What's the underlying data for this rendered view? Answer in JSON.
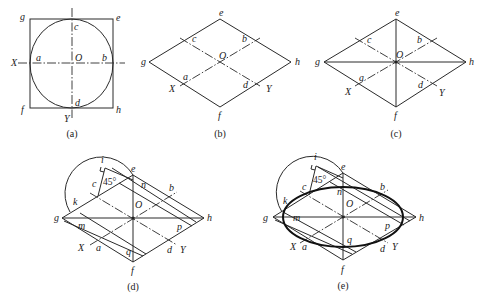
{
  "figure": {
    "panels": [
      {
        "id": "a",
        "caption": "(a)",
        "labels": {
          "g": "g",
          "e": "e",
          "c": "c",
          "X": "X",
          "a": "a",
          "O": "O",
          "b": "b",
          "f": "f",
          "d": "d",
          "h": "h",
          "Y": "Y"
        }
      },
      {
        "id": "b",
        "caption": "(b)",
        "labels": {
          "e": "e",
          "c": "c",
          "b": "b",
          "g": "g",
          "O": "O",
          "h": "h",
          "a": "a",
          "X": "X",
          "d": "d",
          "Y": "Y",
          "f": "f"
        }
      },
      {
        "id": "c",
        "caption": "(c)",
        "labels": {
          "e": "e",
          "c": "c",
          "b": "b",
          "g": "g",
          "O": "O",
          "h": "h",
          "a": "a",
          "X": "X",
          "d": "d",
          "Y": "Y",
          "f": "f"
        }
      },
      {
        "id": "d",
        "caption": "(d)",
        "labels": {
          "i": "i",
          "e": "e",
          "angle": "45°",
          "c": "c",
          "n": "n",
          "b": "b",
          "k": "k",
          "O": "O",
          "g": "g",
          "h": "h",
          "m": "m",
          "p": "p",
          "X": "X",
          "a": "a",
          "q": "q",
          "d": "d",
          "Y": "Y",
          "f": "f"
        }
      },
      {
        "id": "e",
        "caption": "(e)",
        "labels": {
          "i": "i",
          "e": "e",
          "angle": "45°",
          "c": "c",
          "n": "n",
          "b": "b",
          "k": "k",
          "O": "O",
          "g": "g",
          "m": "m",
          "h": "h",
          "p": "p",
          "X": "X",
          "a": "a",
          "q": "q",
          "d": "d",
          "Y": "Y",
          "f": "f"
        }
      }
    ]
  }
}
